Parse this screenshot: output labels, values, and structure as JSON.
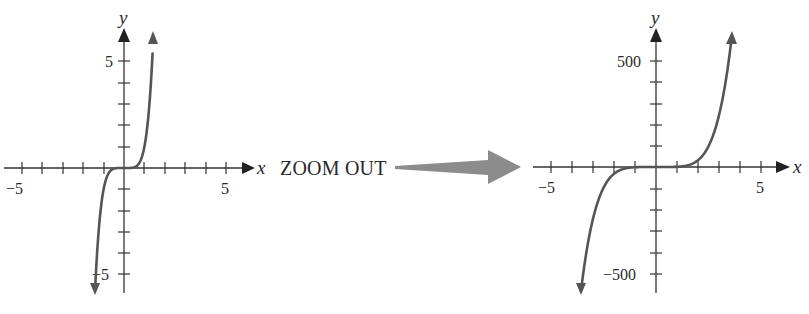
{
  "middle": {
    "label": "ZOOM OUT",
    "arrow_color": "#8c8c8c"
  },
  "colors": {
    "axis": "#333333",
    "curve": "#555555",
    "text": "#2a2a2a"
  },
  "left_graph": {
    "x_axis_label": "x",
    "y_axis_label": "y",
    "x_tick_labels": [
      "−5",
      "5"
    ],
    "y_tick_labels": [
      "5",
      "−5"
    ]
  },
  "right_graph": {
    "x_axis_label": "x",
    "y_axis_label": "y",
    "x_tick_labels": [
      "−5",
      "5"
    ],
    "y_tick_labels": [
      "500",
      "−500"
    ]
  },
  "chart_data": [
    {
      "type": "line",
      "title": "",
      "function": "y = x^5",
      "xlabel": "x",
      "ylabel": "y",
      "xlim": [
        -6,
        6
      ],
      "ylim": [
        -6,
        6
      ],
      "x_ticks": [
        -5,
        -4,
        -3,
        -2,
        -1,
        0,
        1,
        2,
        3,
        4,
        5
      ],
      "y_ticks": [
        -5,
        -4,
        -3,
        -2,
        -1,
        0,
        1,
        2,
        3,
        4,
        5
      ],
      "labeled_x_ticks": [
        -5,
        5
      ],
      "labeled_y_ticks": [
        5,
        -5
      ],
      "grid": false,
      "series": [
        {
          "name": "y = x^5",
          "x": [
            -1.4,
            -1.2,
            -1.0,
            -0.8,
            -0.5,
            0,
            0.5,
            0.8,
            1.0,
            1.2,
            1.4
          ],
          "values": [
            -5.38,
            -2.49,
            -1.0,
            -0.33,
            -0.03,
            0,
            0.03,
            0.33,
            1.0,
            2.49,
            5.38
          ]
        }
      ]
    },
    {
      "type": "line",
      "title": "",
      "function": "y = x^5",
      "xlabel": "x",
      "ylabel": "y",
      "xlim": [
        -6,
        6
      ],
      "ylim": [
        -600,
        600
      ],
      "x_ticks": [
        -5,
        -4,
        -3,
        -2,
        -1,
        0,
        1,
        2,
        3,
        4,
        5
      ],
      "y_ticks": [
        -500,
        -400,
        -300,
        -200,
        -100,
        0,
        100,
        200,
        300,
        400,
        500
      ],
      "labeled_x_ticks": [
        -5,
        5
      ],
      "labeled_y_ticks": [
        500,
        -500
      ],
      "grid": false,
      "series": [
        {
          "name": "y = x^5",
          "x": [
            -3.6,
            -3,
            -2.5,
            -2,
            -1,
            0,
            1,
            2,
            2.5,
            3,
            3.6
          ],
          "values": [
            -604.6,
            -243,
            -97.7,
            -32,
            -1,
            0,
            1,
            32,
            97.7,
            243,
            604.6
          ]
        }
      ]
    }
  ]
}
